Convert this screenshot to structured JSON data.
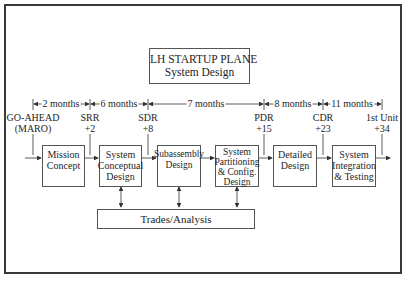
{
  "title": {
    "line1": "LH STARTUP PLANE",
    "line2": "System Design"
  },
  "durations": [
    {
      "label": "2 months",
      "from": "GO-AHEAD",
      "to": "SRR"
    },
    {
      "label": "6 months",
      "from": "SRR",
      "to": "SDR"
    },
    {
      "label": "7 months",
      "from": "SDR",
      "to": "PDR"
    },
    {
      "label": "8 months",
      "from": "PDR",
      "to": "CDR"
    },
    {
      "label": "11 months",
      "from": "CDR",
      "to": "1st Unit"
    }
  ],
  "milestones": [
    {
      "name": "GO-AHEAD",
      "sub": "(MARO)"
    },
    {
      "name": "SRR",
      "sub": "+2"
    },
    {
      "name": "SDR",
      "sub": "+8"
    },
    {
      "name": "PDR",
      "sub": "+15"
    },
    {
      "name": "CDR",
      "sub": "+23"
    },
    {
      "name": "1st Unit",
      "sub": "+34"
    }
  ],
  "phases": [
    {
      "label": "Mission\nConcept"
    },
    {
      "label": "System\nConceptual\nDesign"
    },
    {
      "label": "Subassembly\nDesign"
    },
    {
      "label": "System\nPartitioning\n& Config.\nDesign"
    },
    {
      "label": "Detailed\nDesign"
    },
    {
      "label": "System\nIntegration\n& Testing"
    }
  ],
  "support": {
    "label": "Trades/Analysis"
  }
}
